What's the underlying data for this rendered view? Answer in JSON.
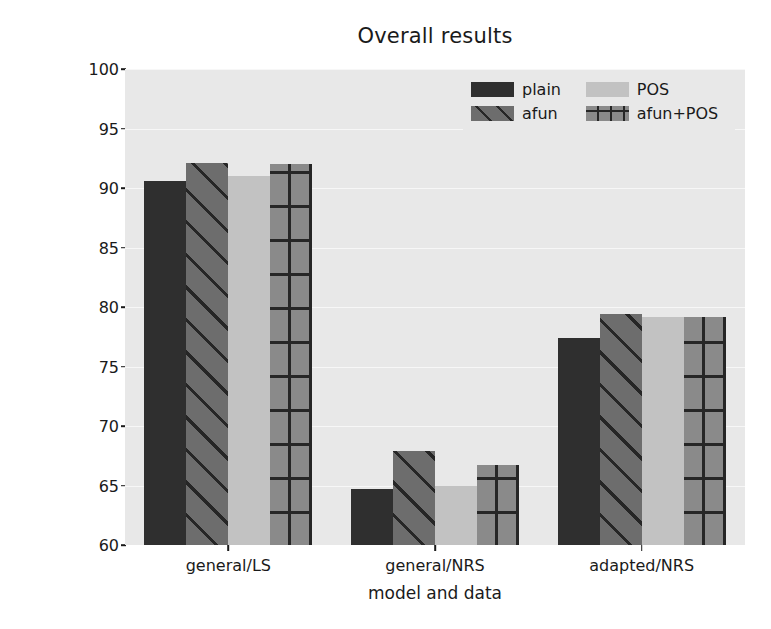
{
  "chart_data": {
    "type": "bar",
    "title": "Overall results",
    "xlabel": "model and data",
    "ylabel": "F1-score",
    "ylim": [
      60,
      100
    ],
    "yticks": [
      100,
      95,
      90,
      85,
      80,
      75,
      70,
      65,
      60
    ],
    "ytick_labels": [
      "100",
      "95",
      "90",
      "85",
      "80",
      "75",
      "70",
      "65",
      "60"
    ],
    "grid": true,
    "legend_position": "upper right",
    "categories": [
      "general/LS",
      "general/NRS",
      "adapted/NRS"
    ],
    "series": [
      {
        "name": "plain",
        "pattern": "solid",
        "color": "#2f2f2f",
        "values": [
          90.6,
          64.7,
          77.4
        ]
      },
      {
        "name": "afun",
        "pattern": "diagonal",
        "color": "#6d6d6d",
        "values": [
          92.1,
          67.9,
          79.4
        ]
      },
      {
        "name": "POS",
        "pattern": "solid-light",
        "color": "#c2c2c2",
        "values": [
          91.0,
          65.0,
          79.2
        ]
      },
      {
        "name": "afun+POS",
        "pattern": "cross-hatch",
        "color": "#8a8a8a",
        "values": [
          92.0,
          66.7,
          79.2
        ]
      }
    ]
  },
  "figure": {
    "background": "#ffffff",
    "axes_background": "#e8e8e8",
    "gridline_color": "#f7f7f7",
    "text_color": "#1a1a1a"
  }
}
